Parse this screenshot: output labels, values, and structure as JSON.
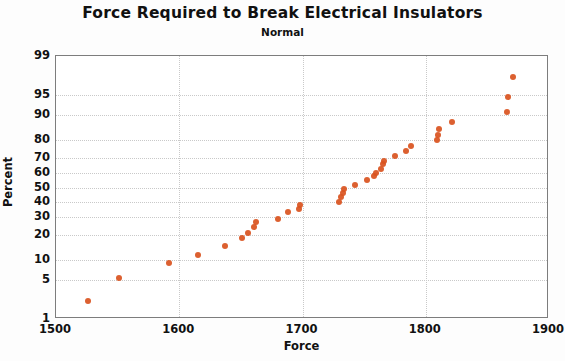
{
  "chart_data": {
    "type": "scatter",
    "title": "Force Required to Break Electrical Insulators",
    "subtitle": "Normal",
    "xlabel": "Force",
    "ylabel": "Percent",
    "xlim": [
      1500,
      1900
    ],
    "ylim": [
      1,
      99
    ],
    "yscale": "normal-probability",
    "grid": true,
    "legend": false,
    "xticks": [
      1500,
      1600,
      1700,
      1800,
      1900
    ],
    "yticks": [
      1,
      5,
      10,
      20,
      30,
      40,
      50,
      60,
      70,
      80,
      90,
      95,
      99
    ],
    "marker": {
      "shape": "circle",
      "color": "#d9531e",
      "size": 6
    },
    "points": [
      {
        "force": 1526,
        "percent": 2.2
      },
      {
        "force": 1551,
        "percent": 5.5
      },
      {
        "force": 1592,
        "percent": 9.0
      },
      {
        "force": 1615,
        "percent": 11.5
      },
      {
        "force": 1637,
        "percent": 15.0
      },
      {
        "force": 1651,
        "percent": 18.5
      },
      {
        "force": 1656,
        "percent": 21.0
      },
      {
        "force": 1661,
        "percent": 24.5
      },
      {
        "force": 1662,
        "percent": 27.0
      },
      {
        "force": 1680,
        "percent": 29.0
      },
      {
        "force": 1688,
        "percent": 33.0
      },
      {
        "force": 1697,
        "percent": 35.0
      },
      {
        "force": 1698,
        "percent": 38.0
      },
      {
        "force": 1730,
        "percent": 40.0
      },
      {
        "force": 1731,
        "percent": 43.0
      },
      {
        "force": 1733,
        "percent": 46.0
      },
      {
        "force": 1734,
        "percent": 49.0
      },
      {
        "force": 1743,
        "percent": 52.0
      },
      {
        "force": 1752,
        "percent": 55.0
      },
      {
        "force": 1758,
        "percent": 58.0
      },
      {
        "force": 1760,
        "percent": 60.0
      },
      {
        "force": 1764,
        "percent": 63.0
      },
      {
        "force": 1765,
        "percent": 66.0
      },
      {
        "force": 1766,
        "percent": 68.0
      },
      {
        "force": 1775,
        "percent": 71.0
      },
      {
        "force": 1784,
        "percent": 74.0
      },
      {
        "force": 1788,
        "percent": 77.0
      },
      {
        "force": 1809,
        "percent": 80.0
      },
      {
        "force": 1810,
        "percent": 82.5
      },
      {
        "force": 1811,
        "percent": 85.0
      },
      {
        "force": 1821,
        "percent": 87.5
      },
      {
        "force": 1866,
        "percent": 91.0
      },
      {
        "force": 1867,
        "percent": 94.5
      },
      {
        "force": 1871,
        "percent": 97.5
      }
    ]
  }
}
